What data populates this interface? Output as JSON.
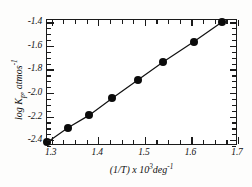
{
  "chart_data": {
    "type": "scatter",
    "title": "",
    "xlabel": "(1/T) x 10³deg⁻¹",
    "ylabel": "log Kp, atmos⁻¹",
    "xlabel_parts": {
      "lead": "(1/T) x 10",
      "exp1": "3",
      "mid": "deg",
      "exp2": "-1"
    },
    "ylabel_parts": {
      "lead": "log K",
      "sub": "p",
      "mid": ", atmos",
      "exp": "-1"
    },
    "xlim": [
      1.29,
      1.7
    ],
    "ylim": [
      -2.45,
      -1.38
    ],
    "xticks": [
      1.3,
      1.4,
      1.5,
      1.6,
      1.7
    ],
    "xticklabels": [
      "1.3",
      "1.4",
      "1.5",
      "1.6",
      "1.7"
    ],
    "xminor_step": 0.025,
    "yticks": [
      -1.4,
      -1.6,
      -1.8,
      -2.0,
      -2.2,
      -2.4
    ],
    "yticklabels": [
      "-1.4",
      "-1.6",
      "-1.8",
      "-2.0",
      "-2.2",
      "-2.4"
    ],
    "yminor_step": 0.05,
    "grid": false,
    "legend": null,
    "legend_position": "none",
    "marker": "filled-circle",
    "marker_color": "#0b0b0b",
    "line_color": "#111111",
    "frame_color": "#1a1a1a",
    "background_color": "#ffffff",
    "series": [
      {
        "name": "log Kp vs 1/T",
        "x": [
          1.29,
          1.335,
          1.38,
          1.43,
          1.485,
          1.54,
          1.605,
          1.665
        ],
        "y": [
          -2.42,
          -2.295,
          -2.19,
          -2.045,
          -1.89,
          -1.735,
          -1.565,
          -1.4
        ],
        "line": true
      }
    ]
  }
}
